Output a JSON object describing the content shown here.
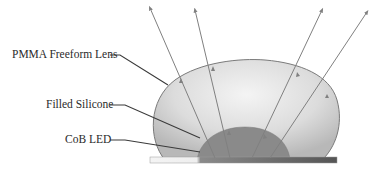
{
  "diagram": {
    "labels": {
      "lens": "PMMA Freeform Lens",
      "silicone": "Filled Silicone",
      "led": "CoB LED"
    },
    "colors": {
      "lens_fill_light": "#f2f2f2",
      "lens_fill_dark": "#c4c4c4",
      "lens_outline": "#7a7a7a",
      "silicone_fill": "#8a8a8a",
      "base_light": "#f4f4f4",
      "base_dark": "#5a5a5a",
      "ray_color": "#808080",
      "leader_color": "#3a3a3a"
    },
    "rays": [
      {
        "from": [
          215,
          158
        ],
        "to": [
          150,
          8
        ]
      },
      {
        "from": [
          230,
          158
        ],
        "to": [
          195,
          10
        ]
      },
      {
        "from": [
          252,
          158
        ],
        "to": [
          322,
          10
        ]
      },
      {
        "from": [
          270,
          158
        ],
        "to": [
          367,
          12
        ]
      }
    ]
  }
}
